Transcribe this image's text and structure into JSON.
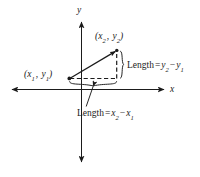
{
  "figure": {
    "type": "coordinate-plane-diagram",
    "background_color": "#ffffff",
    "ink_color": "#1b1b1b",
    "axes": {
      "x_axis_label": "x",
      "y_axis_label": "y",
      "x_axis_y_pixel": 89,
      "y_axis_x_pixel": 81,
      "x_axis_from_pixel": 12,
      "x_axis_to_pixel": 168,
      "y_axis_from_pixel": 18,
      "y_axis_to_pixel": 166
    },
    "points": [
      {
        "name": "point-1",
        "label": "(x1, y1)",
        "label_parts": {
          "open": "(",
          "x_base": "x",
          "x_sub": "1",
          "comma": ", ",
          "y_base": "y",
          "y_sub": "1",
          "close": ")"
        },
        "pixel": {
          "x": 69,
          "y": 78
        }
      },
      {
        "name": "point-2",
        "label": "(x2, y2)",
        "label_parts": {
          "open": "(",
          "x_base": "x",
          "x_sub": "2",
          "comma": ", ",
          "y_base": "y",
          "y_sub": "2",
          "close": ")"
        },
        "pixel": {
          "x": 117,
          "y": 50
        }
      }
    ],
    "annotations": {
      "vertical_length": {
        "prefix": "Length",
        "equals": "=",
        "minuend_base": "y",
        "minuend_sub": "2",
        "minus": "−",
        "subtrahend_base": "y",
        "subtrahend_sub": "1",
        "full_text": "Length = y2 − y1"
      },
      "horizontal_length": {
        "prefix": "Length",
        "equals": "=",
        "minuend_base": "x",
        "minuend_sub": "2",
        "minus": "−",
        "subtrahend_base": "x",
        "subtrahend_sub": "1",
        "full_text": "Length = x2 − x1"
      }
    },
    "strokes": {
      "hypotenuse_style": "solid-arrow",
      "legs_style": "dashed",
      "brace_style": "curly-brace"
    }
  }
}
